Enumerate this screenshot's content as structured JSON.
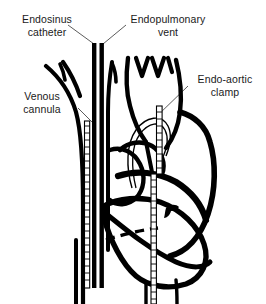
{
  "figure": {
    "background_color": "#ffffff",
    "ink_color": "#000000",
    "text_color": "#1a1a1a",
    "width": 266,
    "height": 304
  },
  "labels": {
    "endosinus_catheter": "Endosinus\ncatheter",
    "endopulmonary_vent": "Endopulmonary\nvent",
    "venous_cannula": "Venous\ncannula",
    "endo_aortic_clamp": "Endo-aortic\nclamp"
  },
  "structures": [
    {
      "name": "superior-vena-cava",
      "description": "Left great vein trunk descending into right atrium"
    },
    {
      "name": "aortic-arch",
      "description": "Arch with three brachiocephalic branch vessels"
    },
    {
      "name": "pulmonary-artery",
      "description": "Main pulmonary trunk crossing the heart base"
    },
    {
      "name": "heart-silhouette",
      "description": "Ventricular mass outline"
    },
    {
      "name": "coronary-vessel-marker",
      "description": "Small coronary branch mark on ventricle"
    },
    {
      "name": "dashed-incision-line",
      "description": "Dashed line across ventricle"
    }
  ],
  "devices": [
    {
      "name": "endosinus-catheter",
      "style": "solid-black-tube",
      "entry": "top-center-left"
    },
    {
      "name": "endopulmonary-vent",
      "style": "solid-black-tube",
      "entry": "top-center-right"
    },
    {
      "name": "venous-cannula",
      "style": "ladder-hatched-tube",
      "entry": "left-venous-trunk"
    },
    {
      "name": "endo-aortic-clamp",
      "style": "hatched-balloon-catheter",
      "entry": "aortic-arch"
    }
  ]
}
